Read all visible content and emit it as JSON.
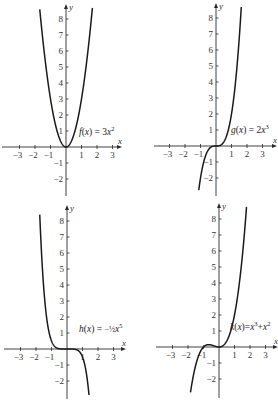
{
  "chart_data": [
    {
      "type": "line",
      "title": "",
      "label": "f(x) = 3x²",
      "label_parts": {
        "name": "f",
        "var": "x",
        "rhs_pre": "3",
        "rhs_var": "x",
        "rhs_sup": "2",
        "rhs_mid": "",
        "rhs_var2": "",
        "rhs_sup2": ""
      },
      "function": "3*x^2",
      "coef": [
        0,
        0,
        3,
        0
      ],
      "xlabel": "x",
      "ylabel": "y",
      "xticks": [
        -3,
        -2,
        -1,
        1,
        2,
        3
      ],
      "yticks": [
        -2,
        -1,
        1,
        2,
        3,
        4,
        5,
        6,
        7,
        8
      ],
      "xlim": [
        -3.7,
        3.7
      ],
      "ylim": [
        -3,
        9
      ],
      "grid": false,
      "layout": {
        "ox": 66,
        "oy": 147,
        "ux": 15.5,
        "uy": 16,
        "xmin_px": 2,
        "xmax_px": 122,
        "ytop_px": 4,
        "ybot_px": 196,
        "label_x": 79,
        "label_y": 135
      }
    },
    {
      "type": "line",
      "title": "",
      "label": "g(x) = 2x³",
      "label_parts": {
        "name": "g",
        "var": "x",
        "rhs_pre": "2",
        "rhs_var": "x",
        "rhs_sup": "3",
        "rhs_mid": "",
        "rhs_var2": "",
        "rhs_sup2": ""
      },
      "function": "2*x^3",
      "coef": [
        0,
        0,
        0,
        2
      ],
      "xlabel": "x",
      "ylabel": "y",
      "xticks": [
        -3,
        -2,
        -1,
        1,
        2,
        3
      ],
      "yticks": [
        -2,
        -1,
        1,
        2,
        3,
        4,
        5,
        6,
        7,
        8
      ],
      "xlim": [
        -3.7,
        3.7
      ],
      "ylim": [
        -3,
        9
      ],
      "grid": false,
      "layout": {
        "ox": 216,
        "oy": 146,
        "ux": 15.5,
        "uy": 16,
        "xmin_px": 154,
        "xmax_px": 277,
        "ytop_px": 3,
        "ybot_px": 196,
        "label_x": 231,
        "label_y": 133
      }
    },
    {
      "type": "line",
      "title": "",
      "label": "h(x) = -½x⁵",
      "label_parts": {
        "name": "h",
        "var": "x",
        "rhs_pre": "−½",
        "rhs_var": "x",
        "rhs_sup": "5",
        "rhs_mid": "",
        "rhs_var2": "",
        "rhs_sup2": ""
      },
      "function": "-(1/2)*x^5",
      "coef5": -0.5,
      "xlabel": "x",
      "ylabel": "y",
      "xticks": [
        -3,
        -2,
        -1,
        1,
        2,
        3
      ],
      "yticks": [
        -2,
        -1,
        1,
        2,
        3,
        4,
        5,
        6,
        7,
        8
      ],
      "xlim": [
        -3.7,
        3.7
      ],
      "ylim": [
        -3,
        9
      ],
      "grid": false,
      "layout": {
        "ox": 67,
        "oy": 349,
        "ux": 15.5,
        "uy": 16,
        "xmin_px": 4,
        "xmax_px": 126,
        "ytop_px": 205,
        "ybot_px": 399,
        "label_x": 79,
        "label_y": 332
      }
    },
    {
      "type": "line",
      "title": "",
      "label": "k(x)=x³+x²",
      "label_parts": {
        "name": "k",
        "var": "x",
        "rhs_pre": "",
        "rhs_var": "x",
        "rhs_sup": "3",
        "rhs_mid": "+",
        "rhs_var2": "x",
        "rhs_sup2": "2"
      },
      "function": "x^3+x^2",
      "coef": [
        0,
        0,
        1,
        1
      ],
      "xlabel": "x",
      "ylabel": "y",
      "xticks": [
        -3,
        -2,
        -1,
        1,
        2,
        3
      ],
      "yticks": [
        -2,
        -1,
        1,
        2,
        3,
        4,
        5,
        6,
        7,
        8
      ],
      "xlim": [
        -3.7,
        3.7
      ],
      "ylim": [
        -3,
        9
      ],
      "grid": false,
      "layout": {
        "ox": 219,
        "oy": 347,
        "ux": 15.5,
        "uy": 16,
        "xmin_px": 156,
        "xmax_px": 278,
        "ytop_px": 203,
        "ybot_px": 398,
        "label_x": 230,
        "label_y": 330
      }
    }
  ]
}
